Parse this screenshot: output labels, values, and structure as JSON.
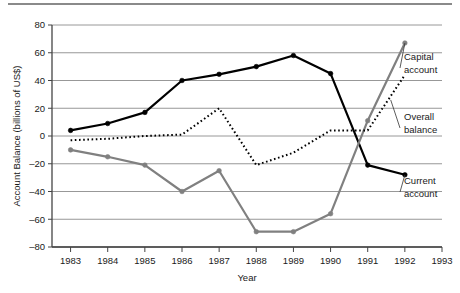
{
  "figure": {
    "has_top_rule": true,
    "background": "#ffffff"
  },
  "chart_data": {
    "type": "line",
    "title": "",
    "subtitle": "",
    "xlabel": "Year",
    "ylabel": "Account  Balance (billions of US$)",
    "x": [
      1983,
      1984,
      1985,
      1986,
      1987,
      1988,
      1989,
      1990,
      1991,
      1992
    ],
    "xticks": [
      "1983",
      "1984",
      "1985",
      "1986",
      "1987",
      "1988",
      "1989",
      "1990",
      "1991",
      "1992",
      "1993"
    ],
    "xlim": [
      1982.5,
      1993.0
    ],
    "yticks": [
      -80,
      -60,
      -40,
      -20,
      0,
      20,
      40,
      60,
      80
    ],
    "ytick_labels": [
      "–80",
      "–60",
      "–40",
      "–20",
      "0",
      "20",
      "40",
      "60",
      "80"
    ],
    "ylim": [
      -80,
      80
    ],
    "grid": "horizontal",
    "legend_position": "right-annotations",
    "series": [
      {
        "name": "Current account",
        "style": "solid-black-markers",
        "color": "#000000",
        "values": [
          4,
          9,
          17,
          40,
          44.5,
          50,
          58,
          45,
          -21,
          -28
        ]
      },
      {
        "name": "Capital account",
        "style": "solid-gray-markers",
        "color": "#808080",
        "values": [
          -10,
          -15,
          -21,
          -40,
          -25,
          -69,
          -69,
          -56,
          11,
          67
        ]
      },
      {
        "name": "Overall balance",
        "style": "dotted-black",
        "color": "#000000",
        "values": [
          -3,
          -2,
          0,
          1,
          20,
          -21,
          -12,
          4,
          4,
          44
        ]
      }
    ],
    "annotations": [
      {
        "text_line1": "Capital",
        "text_line2": "account",
        "series": "Capital account"
      },
      {
        "text_line1": "Overall",
        "text_line2": "balance",
        "series": "Overall balance"
      },
      {
        "text_line1": "Current",
        "text_line2": "account",
        "series": "Current account"
      }
    ]
  }
}
